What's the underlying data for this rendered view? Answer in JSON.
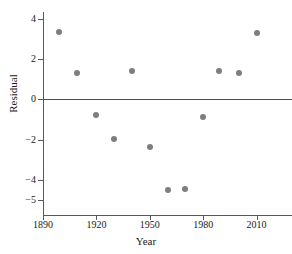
{
  "chart_data": {
    "type": "scatter",
    "title": "",
    "xlabel": "Year",
    "ylabel": "Residual",
    "xlim": [
      1890,
      2030
    ],
    "ylim": [
      -5,
      4.8
    ],
    "grid": false,
    "legend": "none",
    "reference_line": {
      "y": 0,
      "color": "#4a4f53"
    },
    "xticks": [
      1890,
      1920,
      1950,
      1980,
      2010
    ],
    "xtick_labels": [
      "1890",
      "1920",
      "1950",
      "1980",
      "2010"
    ],
    "yticks": [
      4,
      2,
      0,
      -2,
      -4,
      -5
    ],
    "ytick_labels": [
      "4",
      "2",
      "0",
      "−2",
      "−4",
      "−5"
    ],
    "marker": {
      "shape": "circle",
      "color": "#7b7f83",
      "size": 6
    },
    "points": [
      {
        "x": 1899,
        "y": 3.35
      },
      {
        "x": 1909,
        "y": 1.3
      },
      {
        "x": 1920,
        "y": -0.78
      },
      {
        "x": 1930,
        "y": -1.95
      },
      {
        "x": 1940,
        "y": 1.4
      },
      {
        "x": 1950,
        "y": -2.35
      },
      {
        "x": 1960,
        "y": -4.48
      },
      {
        "x": 1970,
        "y": -4.45
      },
      {
        "x": 1980,
        "y": -0.88
      },
      {
        "x": 1989,
        "y": 1.4
      },
      {
        "x": 2000,
        "y": 1.3
      },
      {
        "x": 2010,
        "y": 3.3
      }
    ]
  }
}
